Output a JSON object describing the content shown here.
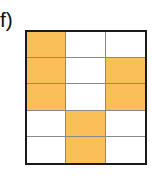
{
  "figure": {
    "label": "f)",
    "grid": {
      "rows": 5,
      "cols": 3,
      "fill_color": "#FBBF5A",
      "empty_color": "#FFFFFF",
      "pattern": [
        [
          1,
          0,
          0
        ],
        [
          1,
          0,
          1
        ],
        [
          1,
          0,
          1
        ],
        [
          0,
          1,
          0
        ],
        [
          0,
          1,
          0
        ]
      ],
      "filled_count": 7,
      "total_cells": 15
    }
  }
}
